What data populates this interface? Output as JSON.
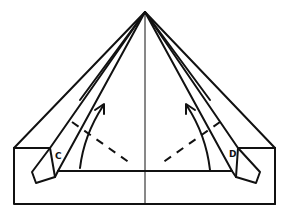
{
  "diagram": {
    "type": "origami-fold-step",
    "labels": {
      "left_flap": "C",
      "right_flap": "D"
    },
    "annotations": [
      {
        "kind": "fold-arrow",
        "side": "left",
        "direction": "up"
      },
      {
        "kind": "fold-arrow",
        "side": "right",
        "direction": "up"
      },
      {
        "kind": "valley-fold-line",
        "side": "left"
      },
      {
        "kind": "valley-fold-line",
        "side": "right"
      }
    ],
    "colors": {
      "line": "#111111",
      "background": "#ffffff"
    }
  }
}
